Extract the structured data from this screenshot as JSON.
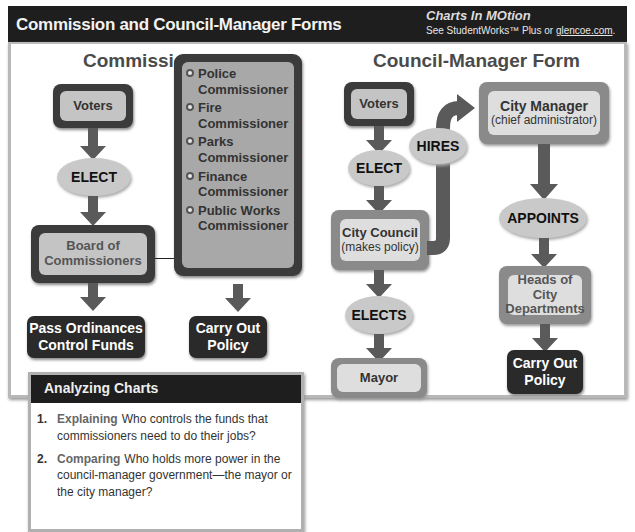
{
  "header": {
    "title": "Commission and Council-Manager Forms",
    "logo": "Charts In MOtion",
    "subtitle_prefix": "See StudentWorks™ Plus or ",
    "subtitle_link": "glencoe.com",
    "subtitle_suffix": "."
  },
  "commission": {
    "title": "Commission Form",
    "voters": "Voters",
    "elect": "ELECT",
    "board_line1": "Board of",
    "board_line2": "Commissioners",
    "commissioners": [
      {
        "line1": "Police",
        "line2": "Commissioner"
      },
      {
        "line1": "Fire",
        "line2": "Commissioner"
      },
      {
        "line1": "Parks",
        "line2": "Commissioner"
      },
      {
        "line1": "Finance",
        "line2": "Commissioner"
      },
      {
        "line1": "Public Works",
        "line2": "Commissioner"
      }
    ],
    "result_left_line1": "Pass Ordinances",
    "result_left_line2": "Control Funds",
    "result_right_line1": "Carry Out",
    "result_right_line2": "Policy"
  },
  "council_manager": {
    "title": "Council-Manager Form",
    "voters": "Voters",
    "elect": "ELECT",
    "hires": "HIRES",
    "city_manager": "City Manager",
    "city_manager_sub": "(chief administrator)",
    "city_council": "City Council",
    "city_council_sub": "(makes policy)",
    "appoints": "APPOINTS",
    "elects": "ELECTS",
    "heads_line1": "Heads of City",
    "heads_line2": "Departments",
    "mayor": "Mayor",
    "result_line1": "Carry Out",
    "result_line2": "Policy"
  },
  "analyzing": {
    "title": "Analyzing Charts",
    "questions": [
      {
        "num": "1.",
        "key": "Explaining",
        "text": "Who controls the funds that commissioners need to do their jobs?"
      },
      {
        "num": "2.",
        "key": "Comparing",
        "text": "Who holds more power in the council-manager government—the mayor or the city manager?"
      }
    ]
  }
}
